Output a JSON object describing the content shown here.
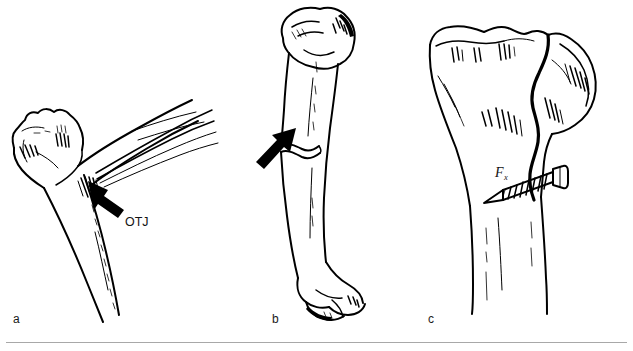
{
  "figure": {
    "type": "line-art-anatomical-illustration",
    "background_color": "#ffffff",
    "ink_color": "#000000",
    "rule_color": "#a8a8a8",
    "panels": [
      {
        "id": "a",
        "label": "a",
        "subject": "proximal long bone with tendon inserting at the osteotendinous junction",
        "callouts": [
          {
            "name": "osteotendinous-junction",
            "text": "OTJ",
            "pointer": "arrow"
          }
        ]
      },
      {
        "id": "b",
        "label": "b",
        "subject": "whole long bone (humerus) with transverse shaft fracture",
        "callouts": [
          {
            "name": "fracture-force",
            "text": "F",
            "subscript": "x",
            "pointer": "arrow"
          }
        ]
      },
      {
        "id": "c",
        "label": "c",
        "subject": "proximal tibia with split fracture fixed by a lag screw",
        "callouts": []
      }
    ]
  },
  "panel_a": {
    "label": "a",
    "otj_label": "OTJ"
  },
  "panel_b": {
    "label": "b",
    "force_label": "F",
    "force_subscript": "x"
  },
  "panel_c": {
    "label": "c"
  }
}
